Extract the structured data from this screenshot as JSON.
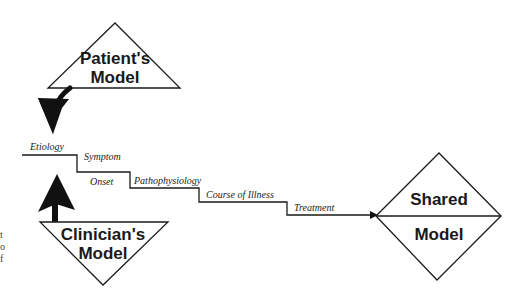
{
  "diagram": {
    "patient_model": {
      "line1": "Patient's",
      "line2": "Model"
    },
    "clinician_model": {
      "line1": "Clinician's",
      "line2": "Model"
    },
    "shared_model": {
      "line1": "Shared",
      "line2": "Model"
    },
    "steps": [
      {
        "label": "Etiology"
      },
      {
        "label": "Symptom"
      },
      {
        "label": "Onset"
      },
      {
        "label": "Pathophysiology"
      },
      {
        "label": "Course of Illness"
      },
      {
        "label": "Treatment"
      }
    ],
    "margin_fragments": [
      "t",
      "o",
      "f"
    ],
    "colors": {
      "stroke": "#1a1a1a",
      "fill_arrow": "#111111",
      "background": "#ffffff"
    }
  }
}
